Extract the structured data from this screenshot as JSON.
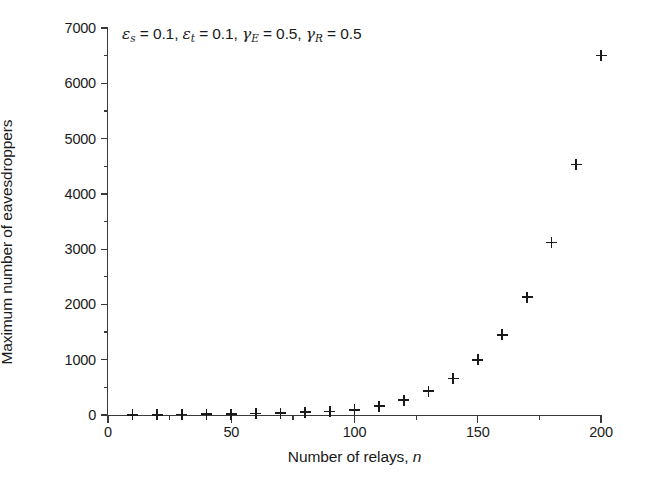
{
  "chart_data": {
    "type": "scatter",
    "title": "",
    "xlabel": "Number of relays, n",
    "xlabel_plain": "Number of relays,",
    "xlabel_italic": "n",
    "ylabel": "Maximum number of eavesdroppers",
    "xlim": [
      0,
      200
    ],
    "ylim": [
      0,
      7000
    ],
    "grid": false,
    "legend": "none",
    "marker": "plus",
    "marker_color": "#1a1a1a",
    "axis_color": "#3a3a3a",
    "xticks": [
      0,
      50,
      100,
      150,
      200
    ],
    "xtick_labels": [
      "0",
      "50",
      "100",
      "150",
      "200"
    ],
    "xminor_ticks": [
      25,
      75,
      125,
      175
    ],
    "yticks": [
      0,
      1000,
      2000,
      3000,
      4000,
      5000,
      6000,
      7000
    ],
    "ytick_labels": [
      "0",
      "1000",
      "2000",
      "3000",
      "4000",
      "5000",
      "6000",
      "7000"
    ],
    "yminor_ticks": [
      500,
      1500,
      2500,
      3500,
      4500,
      5500,
      6500
    ],
    "x": [
      10,
      20,
      30,
      40,
      50,
      60,
      70,
      80,
      90,
      100,
      110,
      120,
      130,
      140,
      150,
      160,
      170,
      180,
      190,
      200
    ],
    "values": [
      2,
      4,
      7,
      11,
      17,
      24,
      34,
      47,
      65,
      95,
      160,
      265,
      430,
      660,
      995,
      1450,
      2130,
      3120,
      4530,
      6500
    ],
    "annotation": {
      "eps_s_label": "ε",
      "eps_s_sub": "s",
      "eps_s_value": "= 0.1,",
      "eps_t_label": "ε",
      "eps_t_sub": "t",
      "eps_t_value": "= 0.1,",
      "gamma_e_label": "γ",
      "gamma_e_sub": "E",
      "gamma_e_value": "= 0.5,",
      "gamma_r_label": "γ",
      "gamma_r_sub": "R",
      "gamma_r_value": "= 0.5",
      "full_text": "εs = 0.1, εt = 0.1, γE = 0.5, γR = 0.5"
    }
  }
}
